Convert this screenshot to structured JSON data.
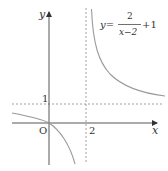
{
  "figure": {
    "function_label": {
      "lhs": "y=",
      "numerator": "2",
      "denominator": "x−2",
      "suffix": "+1"
    },
    "axis_labels": {
      "x": "x",
      "y": "y"
    },
    "tick_labels": {
      "origin": "O",
      "x_asymptote": "2",
      "y_asymptote": "1"
    },
    "asymptotes": {
      "vertical_x": 2,
      "horizontal_y": 1
    },
    "colors": {
      "axis": "#333333",
      "curve": "#9a9a9a",
      "dashed": "#888888",
      "text": "#333333"
    }
  }
}
